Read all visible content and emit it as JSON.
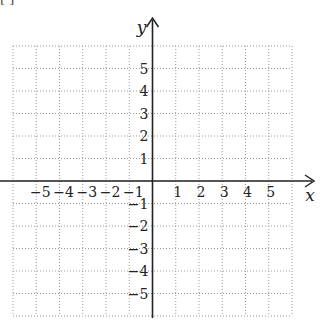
{
  "caption_cut": "[ ]",
  "chart_data": {
    "type": "coordinate-grid",
    "title": "",
    "xlabel": "x",
    "ylabel": "y",
    "xlim": [
      -6,
      6
    ],
    "ylim": [
      -6,
      6
    ],
    "grid": true,
    "grid_style": "dotted",
    "x_ticks": [
      "−5",
      "−4",
      "−3",
      "−2",
      "−1",
      "1",
      "2",
      "3",
      "4",
      "5"
    ],
    "y_ticks": [
      "5",
      "4",
      "3",
      "2",
      "1",
      "−1",
      "−2",
      "−3",
      "−4",
      "−5"
    ],
    "x_tick_values": [
      -5,
      -4,
      -3,
      -2,
      -1,
      1,
      2,
      3,
      4,
      5
    ],
    "y_tick_values": [
      5,
      4,
      3,
      2,
      1,
      -1,
      -2,
      -3,
      -4,
      -5
    ]
  },
  "colors": {
    "axis": "#222222",
    "grid": "#9a9a9a",
    "text": "#222222"
  }
}
